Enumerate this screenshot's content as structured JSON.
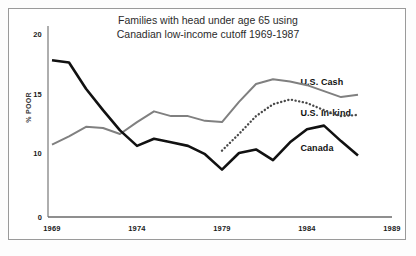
{
  "chart_data": {
    "type": "line",
    "title_line1": "Families with head under age 65 using",
    "title_line2": "Canadian low-income cutoff 1969-1987",
    "xlabel": "",
    "ylabel": "% POOR",
    "x": [
      1969,
      1970,
      1971,
      1972,
      1973,
      1974,
      1975,
      1976,
      1977,
      1978,
      1979,
      1980,
      1981,
      1982,
      1983,
      1984,
      1985,
      1986,
      1987
    ],
    "xticks": [
      "1969",
      "1974",
      "1979",
      "1984",
      "1989"
    ],
    "xtick_values": [
      1969,
      1974,
      1979,
      1984,
      1989
    ],
    "yticks": [
      "0",
      "10",
      "15",
      "20"
    ],
    "ytick_values": [
      0,
      10,
      15,
      20
    ],
    "xlim": [
      1969,
      1989
    ],
    "ylim": [
      4.7,
      20.6
    ],
    "grid": false,
    "legend_position": "right-inline",
    "series": [
      {
        "name": "U.S. Cash",
        "color": "#808080",
        "style": "solid",
        "label_x": 1987.2,
        "label_y": 15.9,
        "x": [
          1969,
          1970,
          1971,
          1972,
          1973,
          1974,
          1975,
          1976,
          1977,
          1978,
          1979,
          1980,
          1981,
          1982,
          1983,
          1984,
          1985,
          1986,
          1987
        ],
        "values": [
          10.7,
          11.4,
          12.2,
          12.1,
          11.6,
          12.6,
          13.5,
          13.1,
          13.1,
          12.7,
          12.6,
          14.3,
          15.8,
          16.2,
          16.0,
          15.7,
          15.2,
          14.7,
          14.9
        ]
      },
      {
        "name": "U.S. In-kind",
        "color": "#4a4a4a",
        "style": "dotted",
        "label_x": 1987.2,
        "label_y": 13.3,
        "x": [
          1979,
          1980,
          1981,
          1982,
          1983,
          1984,
          1985,
          1986,
          1987
        ],
        "values": [
          10.2,
          11.6,
          13.1,
          14.1,
          14.5,
          14.2,
          13.6,
          13.1,
          13.2
        ]
      },
      {
        "name": "Canada",
        "color": "#111111",
        "style": "solid",
        "label_x": 1987.2,
        "label_y": 10.3,
        "x": [
          1969,
          1970,
          1971,
          1972,
          1973,
          1974,
          1975,
          1976,
          1977,
          1978,
          1979,
          1980,
          1981,
          1982,
          1983,
          1984,
          1985,
          1986,
          1987
        ],
        "values": [
          17.8,
          17.6,
          15.4,
          13.6,
          11.9,
          10.6,
          11.2,
          10.9,
          10.6,
          9.9,
          8.6,
          10.0,
          10.3,
          9.4,
          10.9,
          12.0,
          12.3,
          11.0,
          9.8
        ]
      }
    ]
  }
}
